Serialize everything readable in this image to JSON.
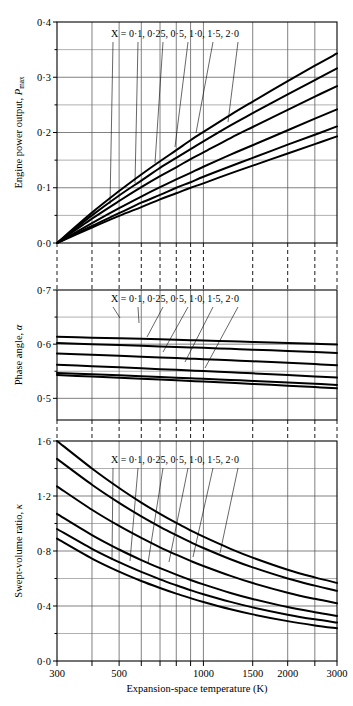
{
  "figure": {
    "background_color": "#ffffff",
    "curve_color": "#000000",
    "grid_color": "#4a4a4a",
    "xlabel": "Expansion-space temperature   (K)",
    "series_label": "X = 0·1, 0·25, 0·5, 1·0, 1·5, 2·0",
    "x_tick_labels": [
      "300",
      "500",
      "1000",
      "1500",
      "2000",
      "3000"
    ],
    "x_tick_values": [
      300,
      500,
      1000,
      1500,
      2000,
      3000
    ],
    "x_gridlines": [
      300,
      400,
      500,
      600,
      700,
      800,
      900,
      1000,
      1500,
      2000,
      2500,
      3000
    ],
    "x_scale": "log",
    "xlim": [
      300,
      3000
    ]
  },
  "chart_data": [
    {
      "id": "panel-power",
      "type": "line",
      "title": "",
      "xlabel": "Expansion-space temperature   (K)",
      "ylabel": "Engine power output, P_max",
      "ylabel_main": "Engine power output,",
      "ylabel_symbol": "P",
      "ylabel_subscript": "max",
      "xscale": "log",
      "xlim": [
        300,
        3000
      ],
      "ylim": [
        0.0,
        0.4
      ],
      "y_tick_labels": [
        "0·0",
        "0·1",
        "0·2",
        "0·3",
        "0·4"
      ],
      "y_tick_values": [
        0.0,
        0.1,
        0.2,
        0.3,
        0.4
      ],
      "y_minor_values": [
        0.05,
        0.15,
        0.25,
        0.35
      ],
      "grid": true,
      "legend": "inline-annotation",
      "annotation": "X = 0·1, 0·25, 0·5, 1·0, 1·5, 2·0",
      "x": [
        300,
        400,
        500,
        600,
        700,
        800,
        900,
        1000,
        1250,
        1500,
        2000,
        2500,
        3000
      ],
      "series": [
        {
          "name": "X = 0·1",
          "values": [
            0.0,
            0.055,
            0.094,
            0.124,
            0.148,
            0.168,
            0.186,
            0.201,
            0.232,
            0.256,
            0.293,
            0.321,
            0.343
          ]
        },
        {
          "name": "X = 0·25",
          "values": [
            0.0,
            0.05,
            0.086,
            0.113,
            0.136,
            0.154,
            0.17,
            0.184,
            0.213,
            0.235,
            0.269,
            0.295,
            0.316
          ]
        },
        {
          "name": "X = 0·5",
          "values": [
            0.0,
            0.044,
            0.076,
            0.101,
            0.121,
            0.137,
            0.152,
            0.164,
            0.19,
            0.21,
            0.241,
            0.265,
            0.284
          ]
        },
        {
          "name": "X = 1·0",
          "values": [
            0.0,
            0.036,
            0.063,
            0.084,
            0.101,
            0.115,
            0.127,
            0.138,
            0.16,
            0.177,
            0.204,
            0.225,
            0.242
          ]
        },
        {
          "name": "X = 1·5",
          "values": [
            0.0,
            0.031,
            0.054,
            0.073,
            0.087,
            0.1,
            0.11,
            0.12,
            0.139,
            0.154,
            0.178,
            0.196,
            0.211
          ]
        },
        {
          "name": "X = 2·0",
          "values": [
            0.0,
            0.028,
            0.049,
            0.065,
            0.079,
            0.09,
            0.1,
            0.108,
            0.126,
            0.14,
            0.162,
            0.179,
            0.193
          ]
        }
      ]
    },
    {
      "id": "panel-phase",
      "type": "line",
      "title": "",
      "xlabel": "Expansion-space temperature   (K)",
      "ylabel": "Phase angle, α",
      "ylabel_main": "Phase angle,",
      "ylabel_symbol": "α",
      "ylabel_subscript": "",
      "xscale": "log",
      "xlim": [
        300,
        3000
      ],
      "ylim": [
        0.46,
        0.7
      ],
      "y_tick_labels": [
        "0·5",
        "0·6",
        "0·7"
      ],
      "y_tick_values": [
        0.5,
        0.6,
        0.7
      ],
      "y_minor_values": [
        0.55,
        0.65
      ],
      "grid": true,
      "legend": "inline-annotation",
      "annotation": "X = 0·1, 0·25, 0·5, 1·0, 1·5, 2·0",
      "x": [
        300,
        400,
        500,
        600,
        700,
        800,
        900,
        1000,
        1250,
        1500,
        2000,
        2500,
        3000
      ],
      "series": [
        {
          "name": "X = 0·1",
          "values": [
            0.6135,
            0.612,
            0.6108,
            0.6098,
            0.6089,
            0.6081,
            0.6074,
            0.6068,
            0.6054,
            0.6042,
            0.6023,
            0.6008,
            0.5995
          ]
        },
        {
          "name": "X = 0·25",
          "values": [
            0.602,
            0.6,
            0.5984,
            0.5971,
            0.5959,
            0.5949,
            0.594,
            0.5932,
            0.5914,
            0.5899,
            0.5874,
            0.5855,
            0.5838
          ]
        },
        {
          "name": "X = 0·5",
          "values": [
            0.583,
            0.5805,
            0.5786,
            0.577,
            0.5756,
            0.5744,
            0.5733,
            0.5723,
            0.5702,
            0.5684,
            0.5655,
            0.5632,
            0.5612
          ]
        },
        {
          "name": "X = 1·0",
          "values": [
            0.562,
            0.5593,
            0.5572,
            0.5554,
            0.5539,
            0.5526,
            0.5514,
            0.5503,
            0.548,
            0.5461,
            0.5429,
            0.5404,
            0.5383
          ]
        },
        {
          "name": "X = 1·5",
          "values": [
            0.547,
            0.5445,
            0.5425,
            0.5408,
            0.5394,
            0.5381,
            0.537,
            0.536,
            0.5339,
            0.5321,
            0.5291,
            0.5268,
            0.5248
          ]
        },
        {
          "name": "X = 2·0",
          "values": [
            0.543,
            0.5402,
            0.538,
            0.5362,
            0.5346,
            0.5332,
            0.532,
            0.5309,
            0.5286,
            0.5266,
            0.5234,
            0.5208,
            0.5187
          ]
        }
      ]
    },
    {
      "id": "panel-swept-volume",
      "type": "line",
      "title": "",
      "xlabel": "Expansion-space temperature   (K)",
      "ylabel": "Swept-volume ratio, κ",
      "ylabel_main": "Swept-volume ratio,",
      "ylabel_symbol": "κ",
      "ylabel_subscript": "",
      "xscale": "log",
      "xlim": [
        300,
        3000
      ],
      "ylim": [
        0.0,
        1.6
      ],
      "y_tick_labels": [
        "0·0",
        "0·4",
        "0·8",
        "1·2",
        "1·6"
      ],
      "y_tick_values": [
        0.0,
        0.4,
        0.8,
        1.2,
        1.6
      ],
      "y_minor_values": [
        0.2,
        0.6,
        1.0,
        1.4
      ],
      "grid": true,
      "legend": "inline-annotation",
      "annotation": "X = 0·1, 0·25, 0·5, 1·0, 1·5, 2·0",
      "x": [
        300,
        400,
        500,
        600,
        700,
        800,
        900,
        1000,
        1250,
        1500,
        2000,
        2500,
        3000
      ],
      "series": [
        {
          "name": "X = 0·1",
          "values": [
            1.6,
            1.4,
            1.258,
            1.152,
            1.07,
            1.004,
            0.95,
            0.904,
            0.816,
            0.752,
            0.664,
            0.608,
            0.568
          ]
        },
        {
          "name": "X = 0·25",
          "values": [
            1.47,
            1.282,
            1.15,
            1.052,
            0.976,
            0.915,
            0.864,
            0.822,
            0.74,
            0.681,
            0.6,
            0.548,
            0.51
          ]
        },
        {
          "name": "X = 0·5",
          "values": [
            1.27,
            1.1,
            0.982,
            0.895,
            0.827,
            0.773,
            0.728,
            0.691,
            0.619,
            0.567,
            0.497,
            0.452,
            0.42
          ]
        },
        {
          "name": "X = 1·0",
          "values": [
            1.07,
            0.916,
            0.811,
            0.734,
            0.675,
            0.628,
            0.589,
            0.557,
            0.495,
            0.451,
            0.392,
            0.355,
            0.328
          ]
        },
        {
          "name": "X = 1·5",
          "values": [
            0.96,
            0.816,
            0.719,
            0.648,
            0.594,
            0.551,
            0.515,
            0.486,
            0.43,
            0.39,
            0.337,
            0.303,
            0.28
          ]
        },
        {
          "name": "X = 2·0",
          "values": [
            0.89,
            0.745,
            0.65,
            0.582,
            0.531,
            0.49,
            0.457,
            0.429,
            0.376,
            0.339,
            0.29,
            0.259,
            0.238
          ]
        }
      ]
    }
  ]
}
